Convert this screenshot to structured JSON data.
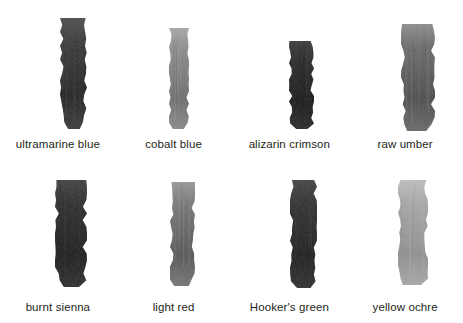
{
  "chart_data": {
    "type": "table",
    "title": "",
    "subtitle": "",
    "xlabel": "",
    "ylabel": "",
    "layout": {
      "columns": 4,
      "rows": 2,
      "background": "#ffffff",
      "legend": "none",
      "grid": false
    },
    "categories": [
      "ultramarine blue",
      "cobalt blue",
      "alizarin crimson",
      "raw umber",
      "burnt sienna",
      "light red",
      "Hooker's green",
      "yellow ochre"
    ],
    "values": [
      58,
      138,
      42,
      106,
      46,
      119,
      48,
      168
    ],
    "value_meaning": "mean grayscale luminance of swatch (0-255)"
  },
  "swatches": {
    "row1": [
      {
        "label": "ultramarine blue",
        "name": "swatch-ultramarine-blue",
        "color": "#3a3a3a",
        "color_light": "#4e4e4e",
        "color_dark": "#242424",
        "x": 60,
        "y": 18,
        "width": 27,
        "height": 111
      },
      {
        "label": "cobalt blue",
        "name": "swatch-cobalt-blue",
        "color": "#8a8a8a",
        "color_light": "#a9a9a9",
        "color_dark": "#6d6d6d",
        "x": 169,
        "y": 28,
        "width": 20,
        "height": 101
      },
      {
        "label": "alizarin crimson",
        "name": "swatch-alizarin-crimson",
        "color": "#2a2a2a",
        "color_light": "#3c3c3c",
        "color_dark": "#1a1a1a",
        "x": 289,
        "y": 41,
        "width": 25,
        "height": 88
      },
      {
        "label": "raw umber",
        "name": "swatch-raw-umber",
        "color": "#6a6a6a",
        "color_light": "#8e8e8e",
        "color_dark": "#4d4d4d",
        "x": 401,
        "y": 24,
        "width": 34,
        "height": 107
      }
    ],
    "row2": [
      {
        "label": "burnt sienna",
        "name": "swatch-burnt-sienna",
        "color": "#2e2e2e",
        "color_light": "#414141",
        "color_dark": "#1c1c1c",
        "x": 55,
        "y": 18,
        "width": 32,
        "height": 107
      },
      {
        "label": "light red",
        "name": "swatch-light-red",
        "color": "#777777",
        "color_light": "#999999",
        "color_dark": "#565656",
        "x": 170,
        "y": 20,
        "width": 25,
        "height": 104
      },
      {
        "label": "Hooker's green",
        "name": "swatch-hookers-green",
        "color": "#303030",
        "color_light": "#444444",
        "color_dark": "#1e1e1e",
        "x": 290,
        "y": 18,
        "width": 27,
        "height": 108
      },
      {
        "label": "yellow ochre",
        "name": "swatch-yellow-ochre",
        "color": "#a8a8a8",
        "color_light": "#bfbfbf",
        "color_dark": "#909090",
        "x": 398,
        "y": 18,
        "width": 30,
        "height": 105
      }
    ]
  }
}
